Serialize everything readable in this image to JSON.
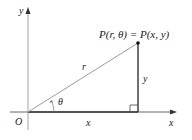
{
  "diagram": {
    "type": "polar-cartesian-relation",
    "colors": {
      "axis": "#555555",
      "radius_line": "#9a9a9a",
      "vertical_line": "#333333",
      "point": "#111111",
      "text": "#1a1a1a"
    },
    "labels": {
      "x_axis": "x",
      "y_axis": "y",
      "origin": "O",
      "radius": "r",
      "angle": "θ",
      "horizontal_leg": "x",
      "vertical_leg": "y",
      "point": "P(r, θ) = P(x, y)"
    },
    "geometry": {
      "origin": [
        28,
        112
      ],
      "point": [
        138,
        43
      ],
      "x_axis_range": [
        10,
        177
      ],
      "y_axis_range": [
        7,
        130
      ]
    }
  }
}
